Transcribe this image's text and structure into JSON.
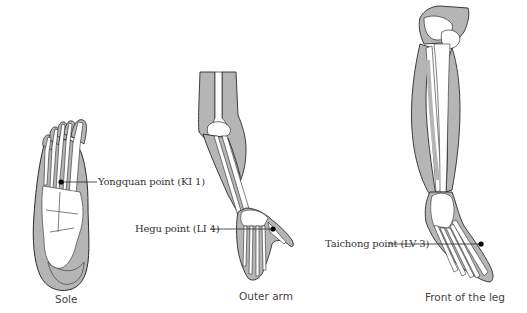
{
  "figures": [
    {
      "id": "sole",
      "caption": "Sole",
      "point_label": "Yongquan point (KI 1)"
    },
    {
      "id": "outer-arm",
      "caption": "Outer arm",
      "point_label": "Hegu point (LI 4)"
    },
    {
      "id": "front-of-leg",
      "caption": "Front of the leg",
      "point_label": "Taichong point (LV 3)"
    }
  ],
  "colors": {
    "muscle_fill": "#b5b5b5",
    "bone_fill": "#ffffff",
    "outline": "#2a2a2a",
    "point_marker": "#000000",
    "text": "#333333"
  }
}
